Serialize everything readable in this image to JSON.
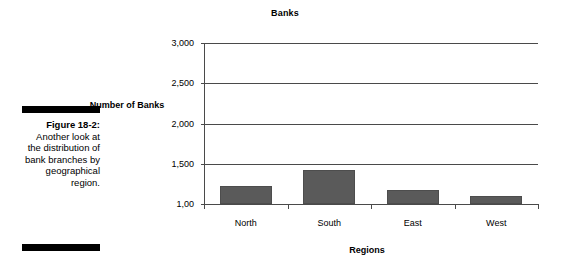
{
  "caption": {
    "figure_number": "Figure 18-2:",
    "text": "Another look at the distribution of bank branches by geographical region."
  },
  "chart_data": {
    "type": "bar",
    "title": "Banks",
    "xlabel": "Regions",
    "ylabel": "Number of Banks",
    "categories": [
      "North",
      "South",
      "East",
      "West"
    ],
    "values": [
      1225,
      1425,
      1175,
      1100
    ],
    "ylim": [
      1000,
      3000
    ],
    "ytick_values": [
      1000,
      1500,
      2000,
      2500,
      3000
    ],
    "ytick_labels": [
      "1,00",
      "1,500",
      "2,000",
      "2,500",
      "3,000"
    ],
    "grid": true,
    "legend": "none",
    "bar_color": "#5a5a5a",
    "axis_color": "#4a4a4a"
  }
}
